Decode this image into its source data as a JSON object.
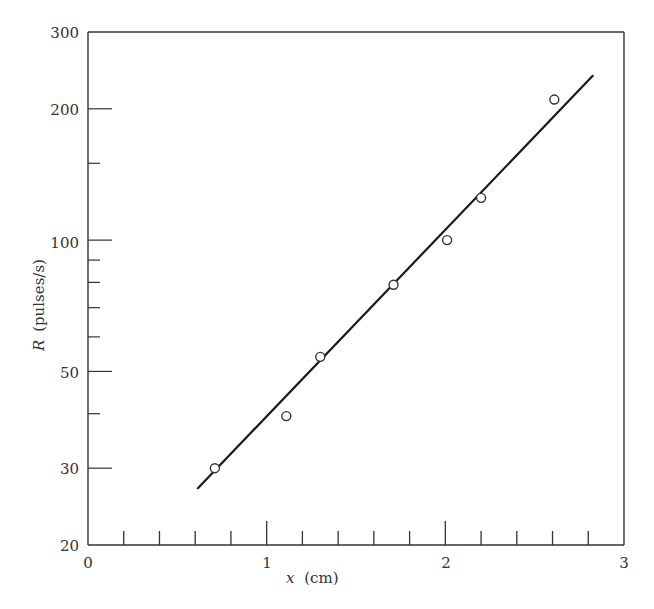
{
  "chart_data": {
    "type": "scatter",
    "title": "",
    "xlabel": "x (cm)",
    "xlabel_var": "x",
    "xlabel_unit": "(cm)",
    "ylabel": "R (pulses/s)",
    "ylabel_var": "R",
    "ylabel_unit": "(pulses/s)",
    "xlim": [
      0,
      3
    ],
    "ylim": [
      20,
      300
    ],
    "yscale": "log",
    "grid": false,
    "legend": null,
    "x_ticks": [
      0,
      1,
      2,
      3
    ],
    "x_tick_labels": [
      "0",
      "1",
      "2",
      "3"
    ],
    "x_minor_step": 0.2,
    "y_ticks": [
      20,
      30,
      50,
      100,
      200,
      300
    ],
    "y_tick_labels": [
      "20",
      "30",
      "50",
      "100",
      "200",
      "300"
    ],
    "y_minor_ticks": [
      40,
      60,
      70,
      80,
      90,
      150
    ],
    "series": [
      {
        "name": "measured",
        "marker": "open-circle",
        "x": [
          0.71,
          1.11,
          1.3,
          1.71,
          2.01,
          2.2,
          2.61
        ],
        "y": [
          30,
          39.5,
          54,
          79,
          100,
          125,
          210
        ]
      },
      {
        "name": "fit",
        "style": "line",
        "x": [
          0.615,
          2.825
        ],
        "y": [
          27,
          238
        ]
      }
    ]
  },
  "labels": {
    "x0": "0",
    "x1": "1",
    "x2": "2",
    "x3": "3",
    "y20": "20",
    "y30": "30",
    "y50": "50",
    "y100": "100",
    "y200": "200",
    "y300": "300",
    "xvar": "x",
    "xunit": "(cm)",
    "yvar": "R",
    "yunit": "(pulses/s)"
  }
}
